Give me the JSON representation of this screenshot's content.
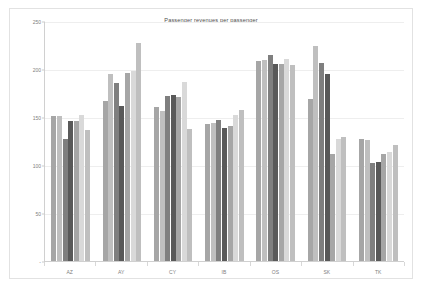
{
  "chart_data": {
    "type": "bar",
    "title": "Passenger revenues per passenger",
    "xlabel": "",
    "ylabel": "",
    "ylim": [
      0,
      250
    ],
    "yticks": [
      0,
      50,
      100,
      150,
      200,
      250
    ],
    "ytick_labels": [
      "-",
      "50",
      "100",
      "150",
      "200",
      "250"
    ],
    "grid": true,
    "legend": "none",
    "categories": [
      "AZ",
      "AY",
      "CY",
      "IB",
      "OS",
      "SK",
      "TK"
    ],
    "series": [
      {
        "name": "Series 1",
        "color": "#a6a6a6",
        "values": [
          152,
          168,
          161,
          144,
          209,
          170,
          128
        ]
      },
      {
        "name": "Series 2",
        "color": "#bfbfbf",
        "values": [
          152,
          196,
          157,
          145,
          210,
          225,
          127
        ]
      },
      {
        "name": "Series 3",
        "color": "#7f7f7f",
        "values": [
          128,
          186,
          173,
          148,
          216,
          207,
          103
        ]
      },
      {
        "name": "Series 4",
        "color": "#595959",
        "values": [
          147,
          163,
          174,
          140,
          206,
          196,
          104
        ]
      },
      {
        "name": "Series 5",
        "color": "#a6a6a6",
        "values": [
          147,
          197,
          172,
          142,
          206,
          113,
          112
        ]
      },
      {
        "name": "Series 6",
        "color": "#d9d9d9",
        "values": [
          153,
          199,
          188,
          153,
          211,
          128,
          115
        ]
      },
      {
        "name": "Series 7",
        "color": "#bfbfbf",
        "values": [
          137,
          228,
          139,
          158,
          205,
          130,
          122
        ]
      }
    ]
  },
  "frame": {
    "border_color": "#e2e2e2",
    "background": "#ffffff"
  },
  "axis": {
    "line_color": "#d0d0d0",
    "grid_color": "#eeeeee",
    "label_color": "#808080"
  }
}
